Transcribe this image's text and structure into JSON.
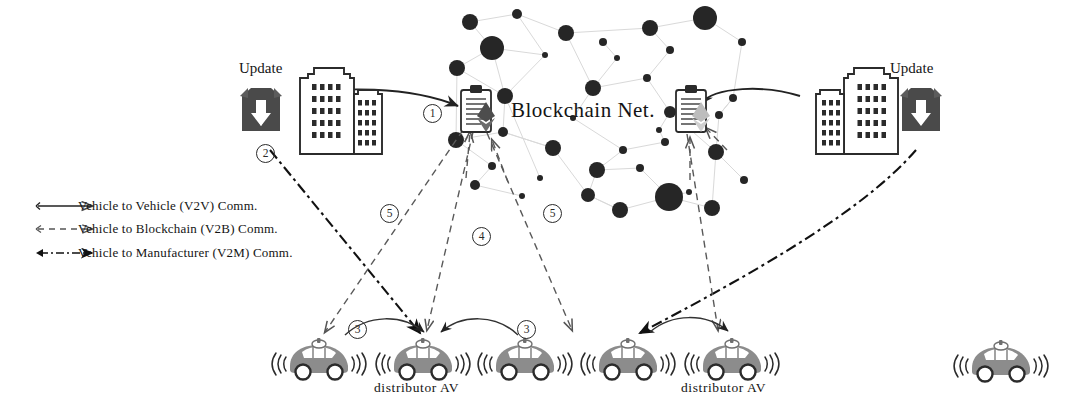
{
  "diagram": {
    "title_center": "Blockchain Net.",
    "update_label_left": "Update",
    "update_label_right": "Update",
    "av_label_left": "distributor AV",
    "av_label_right": "distributor AV",
    "step_markers": [
      {
        "id": "marker-1",
        "text": "①",
        "x": 423,
        "y": 104
      },
      {
        "id": "marker-2",
        "text": "②",
        "x": 256,
        "y": 144
      },
      {
        "id": "marker-3-left",
        "text": "③",
        "x": 348,
        "y": 320
      },
      {
        "id": "marker-3-right",
        "text": "③",
        "x": 517,
        "y": 320
      },
      {
        "id": "marker-4",
        "text": "④",
        "x": 472,
        "y": 227
      },
      {
        "id": "marker-5-left",
        "text": "⑤",
        "x": 380,
        "y": 204
      },
      {
        "id": "marker-5-right",
        "text": "⑤",
        "x": 543,
        "y": 204
      }
    ],
    "legend": {
      "items": [
        {
          "id": "legend-v2v",
          "label": "Vehicle to Vehicle (V2V) Comm.",
          "style": "solid",
          "color": "#222222"
        },
        {
          "id": "legend-v2b",
          "label": "Vehicle to Blockchain (V2B) Comm.",
          "style": "dashed",
          "color": "#555555"
        },
        {
          "id": "legend-v2m",
          "label": "Vehicle to Manufacturer (V2M) Comm.",
          "style": "dashdot",
          "color": "#111111"
        }
      ]
    },
    "colors": {
      "node_dark": "#262626",
      "node_link": "#d4d4d4",
      "car_body": "#8c8c8c",
      "car_body_dark": "#6f6f6f",
      "update_icon": "#4a4a4a",
      "diamond_dark": "#4d4d4d",
      "diamond_light": "#b3b3b3",
      "outline": "#2b2b2b",
      "background": "#ffffff"
    },
    "vehicles": [
      {
        "id": "av-1",
        "x": 318,
        "y": 358,
        "labeled": false
      },
      {
        "id": "av-2",
        "x": 422,
        "y": 358,
        "labeled": true
      },
      {
        "id": "av-3",
        "x": 524,
        "y": 358,
        "labeled": false
      },
      {
        "id": "av-4",
        "x": 627,
        "y": 358,
        "labeled": true
      },
      {
        "id": "av-5",
        "x": 731,
        "y": 358,
        "labeled": false
      },
      {
        "id": "av-6",
        "x": 1000,
        "y": 360,
        "labeled": false
      }
    ],
    "blockchain_nodes": [
      {
        "x": 470,
        "y": 22,
        "r": 8
      },
      {
        "x": 517,
        "y": 14,
        "r": 5
      },
      {
        "x": 566,
        "y": 33,
        "r": 8
      },
      {
        "x": 603,
        "y": 42,
        "r": 4
      },
      {
        "x": 650,
        "y": 28,
        "r": 8
      },
      {
        "x": 705,
        "y": 18,
        "r": 12
      },
      {
        "x": 492,
        "y": 48,
        "r": 12
      },
      {
        "x": 545,
        "y": 55,
        "r": 3
      },
      {
        "x": 617,
        "y": 58,
        "r": 3
      },
      {
        "x": 670,
        "y": 50,
        "r": 4
      },
      {
        "x": 742,
        "y": 42,
        "r": 4
      },
      {
        "x": 457,
        "y": 68,
        "r": 8
      },
      {
        "x": 505,
        "y": 96,
        "r": 8
      },
      {
        "x": 593,
        "y": 88,
        "r": 8
      },
      {
        "x": 647,
        "y": 78,
        "r": 4
      },
      {
        "x": 733,
        "y": 98,
        "r": 4
      },
      {
        "x": 456,
        "y": 140,
        "r": 8
      },
      {
        "x": 503,
        "y": 132,
        "r": 5
      },
      {
        "x": 553,
        "y": 148,
        "r": 8
      },
      {
        "x": 623,
        "y": 150,
        "r": 4
      },
      {
        "x": 665,
        "y": 142,
        "r": 4
      },
      {
        "x": 670,
        "y": 112,
        "r": 6
      },
      {
        "x": 492,
        "y": 166,
        "r": 4
      },
      {
        "x": 597,
        "y": 170,
        "r": 8
      },
      {
        "x": 640,
        "y": 168,
        "r": 4
      },
      {
        "x": 716,
        "y": 152,
        "r": 8
      },
      {
        "x": 719,
        "y": 115,
        "r": 4
      },
      {
        "x": 744,
        "y": 180,
        "r": 4
      },
      {
        "x": 475,
        "y": 185,
        "r": 5
      },
      {
        "x": 522,
        "y": 196,
        "r": 3
      },
      {
        "x": 588,
        "y": 195,
        "r": 7
      },
      {
        "x": 669,
        "y": 197,
        "r": 14
      },
      {
        "x": 689,
        "y": 192,
        "r": 3
      },
      {
        "x": 620,
        "y": 210,
        "r": 8
      },
      {
        "x": 712,
        "y": 208,
        "r": 8
      },
      {
        "x": 659,
        "y": 130,
        "r": 3
      },
      {
        "x": 573,
        "y": 118,
        "r": 3
      },
      {
        "x": 540,
        "y": 178,
        "r": 3
      }
    ]
  }
}
